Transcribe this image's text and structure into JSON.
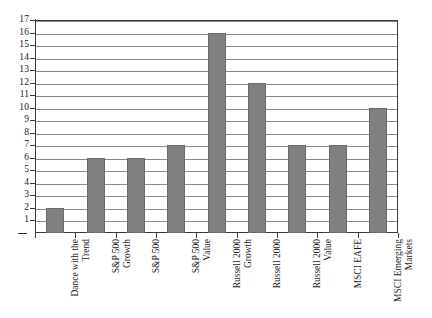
{
  "chart_data": {
    "type": "bar",
    "title": "",
    "subtitle": "",
    "xlabel": "",
    "ylabel": "",
    "ylim": [
      0,
      17
    ],
    "ytick_step": 1,
    "grid": true,
    "legend": false,
    "orientation": "vertical",
    "bar_color": "#808080",
    "bar_edge_color": "#6a6a6a",
    "gridline_color": "#8a8a8a",
    "axis_color": "#3b3b3b",
    "background": "#ffffff",
    "xtick_label_rotation": 90,
    "categories": [
      "Dance with the Trend",
      "S&P 500 Growth",
      "S&P 500",
      "S&P 500 Value",
      "Russell 2000 Growth",
      "Russell 2000",
      "Russell 2000 Value",
      "MSCI EAFE",
      "MSCI Emerging Markets"
    ],
    "category_lines": [
      [
        "Dance with the",
        "Trend"
      ],
      [
        "S&P 500",
        "Growth"
      ],
      [
        "S&P 500",
        ""
      ],
      [
        "S&P 500",
        "Value"
      ],
      [
        "Russell 2000",
        "Growth"
      ],
      [
        "Russell 2000",
        ""
      ],
      [
        "Russell 2000",
        "Value"
      ],
      [
        "MSCI EAFE",
        ""
      ],
      [
        "MSCI Emerging",
        "Markets"
      ]
    ],
    "values": [
      2,
      6,
      6,
      7,
      16,
      12,
      7,
      7,
      10
    ],
    "ytick_labels": [
      "17",
      "16",
      "15",
      "14",
      "13",
      "12",
      "11",
      "10",
      "9",
      "8",
      "7",
      "6",
      "5",
      "4",
      "3",
      "2",
      "1"
    ],
    "ytick_values": [
      17,
      16,
      15,
      14,
      13,
      12,
      11,
      10,
      9,
      8,
      7,
      6,
      5,
      4,
      3,
      2,
      1
    ],
    "baseline_label": "—"
  }
}
